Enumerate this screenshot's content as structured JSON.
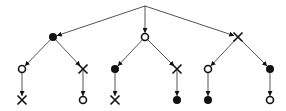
{
  "diagram": {
    "type": "tree",
    "colors": {
      "line": "#555555",
      "node": "#111111",
      "background": "#ffffff"
    },
    "nodes": [
      {
        "id": "root",
        "x": 145,
        "y": 6,
        "shape": "point"
      },
      {
        "id": "a",
        "x": 53,
        "y": 37,
        "shape": "filled-circle"
      },
      {
        "id": "b",
        "x": 145,
        "y": 37,
        "shape": "hollow-circle"
      },
      {
        "id": "c",
        "x": 238,
        "y": 37,
        "shape": "cross"
      },
      {
        "id": "a1",
        "x": 22,
        "y": 69,
        "shape": "hollow-circle"
      },
      {
        "id": "a2",
        "x": 83,
        "y": 69,
        "shape": "cross"
      },
      {
        "id": "b1",
        "x": 115,
        "y": 69,
        "shape": "filled-circle"
      },
      {
        "id": "b2",
        "x": 177,
        "y": 69,
        "shape": "cross"
      },
      {
        "id": "c1",
        "x": 208,
        "y": 69,
        "shape": "hollow-circle"
      },
      {
        "id": "c2",
        "x": 270,
        "y": 69,
        "shape": "filled-circle"
      },
      {
        "id": "a1x",
        "x": 22,
        "y": 100,
        "shape": "cross"
      },
      {
        "id": "a2x",
        "x": 83,
        "y": 100,
        "shape": "hollow-circle"
      },
      {
        "id": "b1x",
        "x": 115,
        "y": 100,
        "shape": "cross"
      },
      {
        "id": "b2x",
        "x": 177,
        "y": 100,
        "shape": "filled-circle"
      },
      {
        "id": "c1x",
        "x": 208,
        "y": 100,
        "shape": "filled-circle"
      },
      {
        "id": "c2x",
        "x": 270,
        "y": 100,
        "shape": "hollow-circle"
      }
    ],
    "edges": [
      [
        "root",
        "a"
      ],
      [
        "root",
        "b"
      ],
      [
        "root",
        "c"
      ],
      [
        "a",
        "a1"
      ],
      [
        "a",
        "a2"
      ],
      [
        "b",
        "b1"
      ],
      [
        "b",
        "b2"
      ],
      [
        "c",
        "c1"
      ],
      [
        "c",
        "c2"
      ],
      [
        "a1",
        "a1x"
      ],
      [
        "a2",
        "a2x"
      ],
      [
        "b1",
        "b1x"
      ],
      [
        "b2",
        "b2x"
      ],
      [
        "c1",
        "c1x"
      ],
      [
        "c2",
        "c2x"
      ]
    ]
  }
}
